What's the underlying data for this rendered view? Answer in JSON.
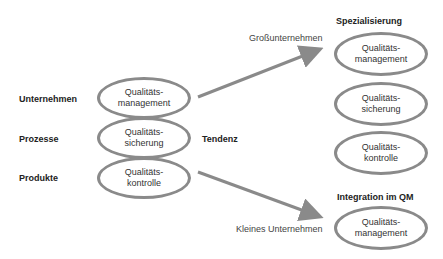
{
  "left": {
    "row_labels": [
      "Unternehmen",
      "Prozesse",
      "Produkte"
    ],
    "ellipses": [
      {
        "line1": "Qualitäts-",
        "line2": "management"
      },
      {
        "line1": "Qualitäts-",
        "line2": "sicherung"
      },
      {
        "line1": "Qualitäts-",
        "line2": "kontrolle"
      }
    ]
  },
  "center": {
    "label": "Tendenz"
  },
  "arrows": {
    "upper_label": "Großunternehmen",
    "lower_label": "Kleines Unternehmen"
  },
  "right_top": {
    "title": "Spezialisierung",
    "ellipses": [
      {
        "line1": "Qualitäts-",
        "line2": "management"
      },
      {
        "line1": "Qualitäts-",
        "line2": "sicherung"
      },
      {
        "line1": "Qualitäts-",
        "line2": "kontrolle"
      }
    ]
  },
  "right_bottom": {
    "title": "Integration im QM",
    "ellipses": [
      {
        "line1": "Qualitäts-",
        "line2": "management"
      }
    ]
  },
  "colors": {
    "stroke": "#8a8a8a",
    "text": "#222222"
  }
}
